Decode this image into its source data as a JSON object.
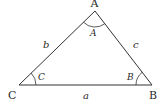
{
  "diagram": {
    "type": "triangle",
    "vertices": {
      "A": {
        "label": "A",
        "x": 95,
        "y": 11
      },
      "B": {
        "label": "B",
        "x": 152,
        "y": 85
      },
      "C": {
        "label": "C",
        "x": 19,
        "y": 85
      }
    },
    "sides": {
      "a": {
        "label": "a",
        "between": [
          "B",
          "C"
        ]
      },
      "b": {
        "label": "b",
        "between": [
          "A",
          "C"
        ]
      },
      "c": {
        "label": "c",
        "between": [
          "A",
          "B"
        ]
      }
    },
    "angles": {
      "A": {
        "label": "A"
      },
      "B": {
        "label": "B"
      },
      "C": {
        "label": "C"
      }
    },
    "colors": {
      "stroke": "#333333",
      "text": "#2a2a2a",
      "background": "#ffffff"
    }
  }
}
